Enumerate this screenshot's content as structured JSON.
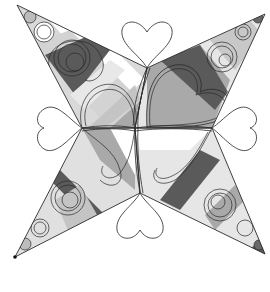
{
  "diagram": {
    "type": "quilting-motif",
    "canvas": {
      "width": 270,
      "height": 292
    },
    "center": [
      135,
      128
    ],
    "colors": {
      "background": "#ffffff",
      "light": "#d9d9d9",
      "medium": "#a9a9a9",
      "dark": "#5a5a5a",
      "stroke": "#2a2a2a"
    },
    "arms": [
      {
        "name": "top-left",
        "tip": [
          17,
          5
        ],
        "side_a": [
          147,
          68
        ],
        "side_b": [
          82,
          128
        ]
      },
      {
        "name": "top-right",
        "tip": [
          265,
          14
        ],
        "side_a": [
          147,
          68
        ],
        "side_b": [
          212,
          128
        ]
      },
      {
        "name": "bottom-right",
        "tip": [
          265,
          254
        ],
        "side_a": [
          212,
          128
        ],
        "side_b": [
          140,
          193
        ]
      },
      {
        "name": "bottom-left",
        "tip": [
          15,
          257
        ],
        "side_a": [
          82,
          128
        ],
        "side_b": [
          140,
          193
        ]
      }
    ],
    "outer_hearts": [
      {
        "name": "top",
        "base": [
          147,
          68
        ],
        "direction": "up"
      },
      {
        "name": "left",
        "base": [
          82,
          128
        ],
        "direction": "left"
      },
      {
        "name": "right",
        "base": [
          212,
          128
        ],
        "direction": "right"
      },
      {
        "name": "bottom",
        "base": [
          140,
          193
        ],
        "direction": "down"
      }
    ],
    "marker": {
      "position": [
        15,
        257
      ]
    }
  }
}
